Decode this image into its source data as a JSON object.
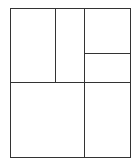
{
  "diagram": {
    "type": "rectangular-partition",
    "stroke_color": "#333333",
    "background": "#ffffff",
    "outer": {
      "x": 10,
      "y": 8,
      "w": 120,
      "h": 149
    },
    "regions": [
      {
        "id": "top-left",
        "x": 10,
        "y": 8,
        "w": 45,
        "h": 74
      },
      {
        "id": "top-middle",
        "x": 55,
        "y": 8,
        "w": 29,
        "h": 74
      },
      {
        "id": "top-right-upper",
        "x": 84,
        "y": 8,
        "w": 46,
        "h": 45
      },
      {
        "id": "top-right-lower",
        "x": 84,
        "y": 53,
        "w": 46,
        "h": 29
      },
      {
        "id": "bottom-left",
        "x": 10,
        "y": 82,
        "w": 74,
        "h": 75
      },
      {
        "id": "bottom-right",
        "x": 84,
        "y": 82,
        "w": 46,
        "h": 75
      }
    ]
  }
}
